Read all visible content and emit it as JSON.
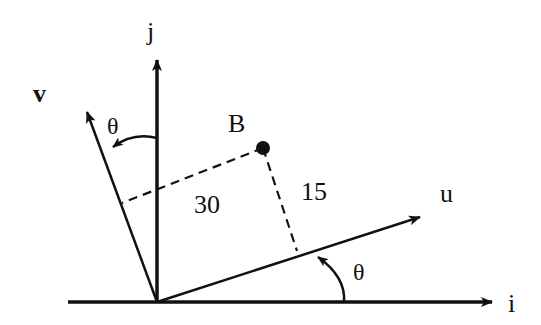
{
  "diagram": {
    "title": "",
    "colors": {
      "ink": "#111111",
      "background": "#ffffff"
    },
    "labels": {
      "i_axis": "i",
      "j_axis": "j",
      "u_axis": "u",
      "v_axis": "v",
      "point": "B",
      "angle_top": "θ",
      "angle_bottom": "θ",
      "dist_along_v": "30",
      "dist_along_u": "15"
    },
    "geometry": {
      "origin": [
        157,
        302
      ],
      "point_B": [
        263,
        148
      ],
      "u_tip": [
        422,
        216
      ],
      "v_tip": [
        86,
        110
      ],
      "i_tip": [
        492,
        302
      ],
      "j_tip": [
        157,
        58
      ]
    }
  }
}
